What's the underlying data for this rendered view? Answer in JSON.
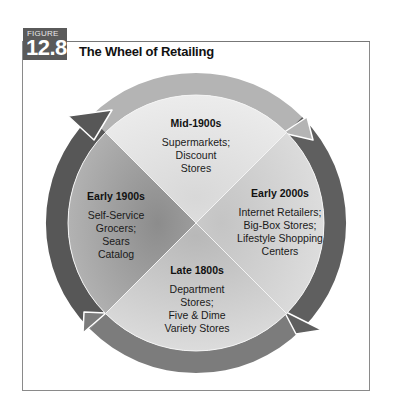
{
  "figure": {
    "label": "FIGURE",
    "number": "12.8",
    "title": "The Wheel of Retailing"
  },
  "colors": {
    "badge": "#5a5a5a",
    "ring_top": "#b4b4b4",
    "ring_right": "#5f5f5f",
    "ring_bottom": "#7c7c7c",
    "ring_left": "#575757",
    "wedge_top": "#e2e2e2",
    "wedge_right": "#d2d2d2",
    "wedge_bottom": "#c8c8c8",
    "wedge_left": "#a9a9a9"
  },
  "wheel": {
    "direction": "clockwise",
    "segments": [
      {
        "position": "top",
        "era": "Mid-1900s",
        "lines": [
          "Supermarkets;",
          "Discount",
          "Stores"
        ]
      },
      {
        "position": "right",
        "era": "Early 2000s",
        "lines": [
          "Internet Retailers;",
          "Big-Box Stores;",
          "Lifestyle Shopping",
          "Centers"
        ]
      },
      {
        "position": "bottom",
        "era": "Late 1800s",
        "lines": [
          "Department",
          "Stores;",
          "Five & Dime",
          "Variety Stores"
        ]
      },
      {
        "position": "left",
        "era": "Early 1900s",
        "lines": [
          "Self-Service",
          "Grocers;",
          "Sears",
          "Catalog"
        ]
      }
    ]
  }
}
